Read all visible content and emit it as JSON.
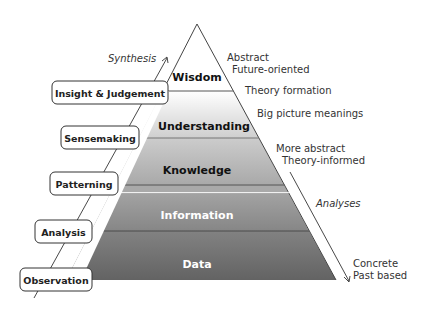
{
  "pyramid": {
    "layers": [
      {
        "label": "Wisdom",
        "color": "#ffffff",
        "text_color": "#111111"
      },
      {
        "label": "Understanding",
        "color": "#dcdcdc",
        "text_color": "#111111"
      },
      {
        "label": "Knowledge",
        "color": "#bdbdbd",
        "text_color": "#111111"
      },
      {
        "label": "Information",
        "color": "#8e8e8e",
        "text_color": "#ffffff"
      },
      {
        "label": "Data",
        "color": "#6a6a6a",
        "text_color": "#ffffff"
      }
    ]
  },
  "processes": [
    {
      "label": "Insight & Judgement"
    },
    {
      "label": "Sensemaking"
    },
    {
      "label": "Patterning"
    },
    {
      "label": "Analysis"
    },
    {
      "label": "Observation"
    }
  ],
  "left_arrow": {
    "label": "Synthesis"
  },
  "right_arrow": {
    "label": "Analyses"
  },
  "descriptions": {
    "top_line1": "Abstract",
    "top_line2": "Future-oriented",
    "theory_formation": "Theory formation",
    "big_picture": "Big picture meanings",
    "more_abstract": "More abstract",
    "theory_informed": "Theory-informed",
    "bottom_line1": "Concrete",
    "bottom_line2": "Past based"
  }
}
